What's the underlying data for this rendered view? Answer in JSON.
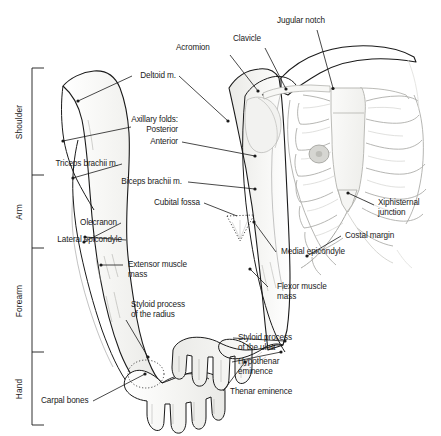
{
  "figure": {
    "background_color": "#ffffff",
    "ink_color": "#1a1a1a",
    "skin_fill": "#f4f4f2",
    "bone_fill": "#f7f7f5"
  },
  "region_brackets": [
    {
      "label": "Shoulder",
      "top": 68,
      "bottom": 175
    },
    {
      "label": "Arm",
      "top": 175,
      "bottom": 248
    },
    {
      "label": "Forearm",
      "top": 248,
      "bottom": 352
    },
    {
      "label": "Hand",
      "top": 352,
      "bottom": 425
    }
  ],
  "labels": {
    "jugular_notch": "Jugular notch",
    "clavicle": "Clavicle",
    "acromion": "Acromion",
    "deltoid": "Deltoid m.",
    "axillary_folds": "Axillary folds:",
    "axillary_posterior": "Posterior",
    "axillary_anterior": "Anterior",
    "triceps": "Triceps brachii m.",
    "biceps": "Biceps brachii m.",
    "cubital_fossa": "Cubital fossa",
    "olecranon": "Olecranon",
    "lateral_epicondyle": "Lateral epicondyle",
    "extensor_muscle_mass": "Extensor muscle\nmass",
    "styloid_radius": "Styloid process\nof the radius",
    "carpal_bones": "Carpal bones",
    "xiphisternal_junction": "Xiphisternal\njunction",
    "costal_margin": "Costal margin",
    "medial_epicondyle": "Medial epicondyle",
    "flexor_muscle_mass": "Flexor muscle\nmass",
    "styloid_ulna": "Styloid process\nof the ulna",
    "hypothenar_eminence": "Hypothenar\neminence",
    "thenar_eminence": "Thenar eminence"
  }
}
